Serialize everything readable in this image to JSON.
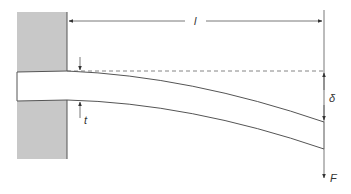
{
  "diagram": {
    "labels": {
      "length": "l",
      "thickness": "t",
      "deflection": "δ",
      "force": "F"
    },
    "colors": {
      "wall": "#c8c8c8",
      "line": "#444444",
      "beam_fill": "#ffffff"
    }
  }
}
